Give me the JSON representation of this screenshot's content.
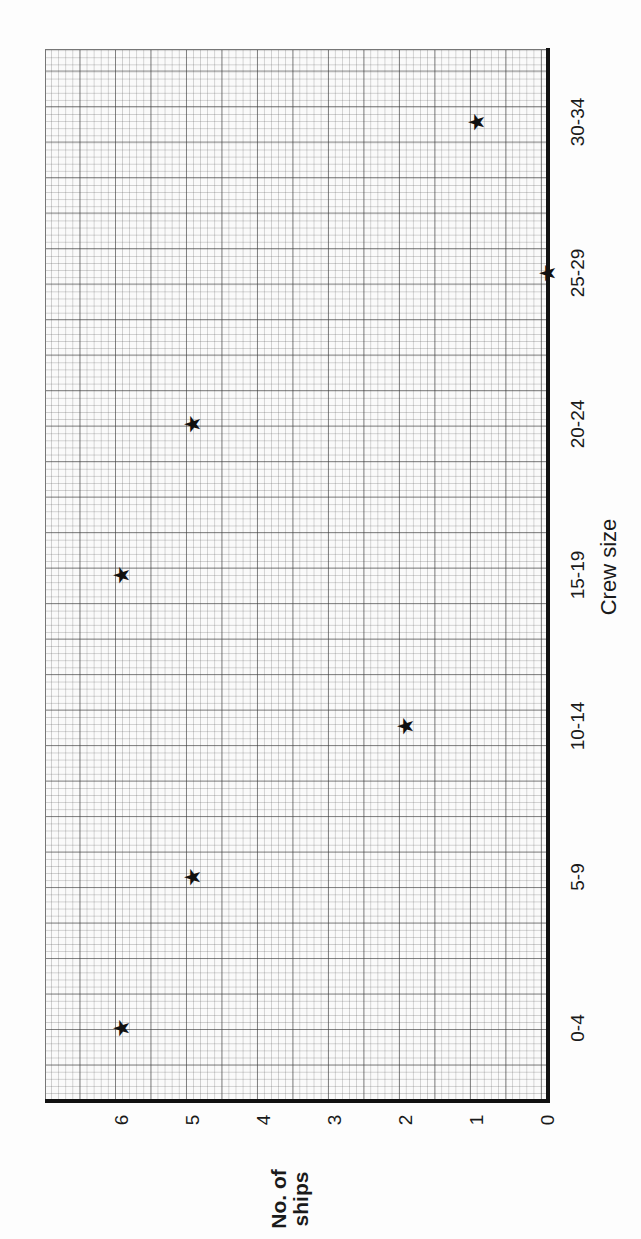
{
  "chart_data": {
    "type": "scatter",
    "title": "",
    "xlabel": "Crew size",
    "ylabel": "No. of ships",
    "categories": [
      "0-4",
      "5-9",
      "10-14",
      "15-19",
      "20-24",
      "25-29",
      "30-34"
    ],
    "values": [
      6,
      5,
      2,
      6,
      5,
      0,
      1
    ],
    "ylim": [
      0,
      6
    ],
    "yticks": [
      "0",
      "1",
      "2",
      "3",
      "4",
      "5",
      "6"
    ],
    "marker": "star",
    "grid": true,
    "orientation": "rotated 90 degrees counter-clockwise (graph paper)"
  },
  "labels": {
    "x_axis": "Crew size",
    "y_axis_line1": "No. of",
    "y_axis_line2": "ships"
  },
  "icons": {
    "marker": "★"
  }
}
